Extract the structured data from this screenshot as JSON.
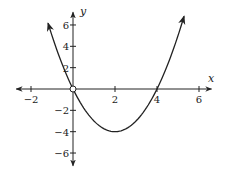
{
  "chart_data": {
    "type": "line",
    "title": "",
    "xlabel": "x",
    "ylabel": "y",
    "xlim": [
      -2.7,
      6.6
    ],
    "ylim": [
      -7.2,
      7.2
    ],
    "grid": false,
    "legend": null,
    "x_ticks": [
      -2,
      2,
      4,
      6
    ],
    "x_tick_labels": [
      "−2",
      "2",
      "4",
      "6"
    ],
    "y_ticks": [
      6,
      4,
      2,
      -2,
      -4,
      -6
    ],
    "y_tick_labels": [
      "6",
      "4",
      "2",
      "−2",
      "−4",
      "−6"
    ],
    "series": [
      {
        "name": "parabola",
        "equation": "y = x^2 - 4x",
        "x_range": [
          -1.19,
          5.29
        ],
        "vertex": [
          2,
          -4
        ],
        "roots": [
          0,
          4
        ],
        "endpoints": "arrows",
        "color": "#222222"
      }
    ],
    "annotations": [
      {
        "type": "open-circle",
        "at": [
          0,
          0
        ]
      }
    ]
  },
  "axes": {
    "x_label": "x",
    "y_label": "y"
  }
}
